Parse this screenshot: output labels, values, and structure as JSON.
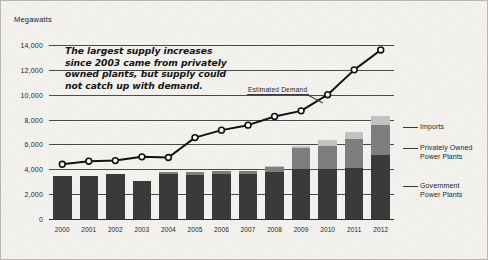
{
  "chart_data": {
    "type": "bar",
    "subtype": "stacked-bar-with-line-overlay",
    "title": "",
    "xlabel": "",
    "ylabel": "Megawatts",
    "ylim": [
      0,
      14000
    ],
    "ytick_step": 2000,
    "ytick_labels": [
      "14,000",
      "12,000",
      "10,000",
      "8,000",
      "6,000",
      "4,000",
      "2,000",
      "0"
    ],
    "ytick_values": [
      14000,
      12000,
      10000,
      8000,
      6000,
      4000,
      2000,
      0
    ],
    "grid": true,
    "legend_position": "right",
    "categories": [
      "2000",
      "2001",
      "2002",
      "2003",
      "2004",
      "2005",
      "2006",
      "2007",
      "2008",
      "2009",
      "2010",
      "2011",
      "2012"
    ],
    "series": [
      {
        "name": "Government Power Plants",
        "type": "bar-segment",
        "color": "#3b3a3a",
        "values": [
          3450,
          3450,
          3650,
          3050,
          3600,
          3550,
          3600,
          3600,
          3750,
          4000,
          4050,
          4100,
          5150
        ]
      },
      {
        "name": "Privately Owned Power Plants",
        "type": "bar-segment",
        "color": "#7f7e7e",
        "values": [
          0,
          0,
          0,
          0,
          200,
          200,
          250,
          250,
          450,
          1750,
          1800,
          2300,
          2450
        ]
      },
      {
        "name": "Imports",
        "type": "bar-segment",
        "color": "#c3c2c2",
        "values": [
          0,
          0,
          0,
          0,
          0,
          0,
          0,
          0,
          100,
          150,
          500,
          600,
          650
        ]
      },
      {
        "name": "Estimated Demand",
        "type": "line",
        "color": "#111111",
        "marker": "open-circle",
        "values": [
          4400,
          4650,
          4700,
          5000,
          4950,
          6550,
          7150,
          7550,
          8250,
          8700,
          10000,
          12000,
          13600
        ]
      }
    ],
    "annotations": [
      {
        "name": "supply-note",
        "text": "The largest supply increases since 2003 came from privately owned plants, but supply could not catch up with demand."
      },
      {
        "name": "demand-callout",
        "text": "Estimated Demand",
        "points_to": "2008"
      }
    ]
  },
  "axis": {
    "y_title": "Megawatts"
  },
  "legend": {
    "imports": "Imports",
    "privately_owned_line1": "Privately Owned",
    "privately_owned_line2": "Power Plants",
    "government_line1": "Government",
    "government_line2": "Power Plants"
  },
  "note": {
    "text": "The largest supply increases since 2003 came from privately owned plants, but supply could not catch up with demand."
  },
  "callout": {
    "demand": "Estimated Demand"
  }
}
